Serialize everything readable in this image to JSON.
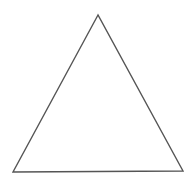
{
  "diagram": {
    "shape": "triangle",
    "kind": "equilateral",
    "stroke_color": "#555555",
    "fill_color": "#ffffff",
    "background": "#ffffff",
    "stroke_width": 1.4,
    "points": "98,15 13,172 183,171"
  }
}
